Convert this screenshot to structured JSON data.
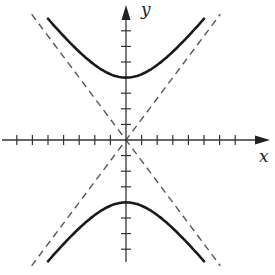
{
  "chart_data": {
    "type": "line",
    "title": "",
    "xlabel": "x",
    "ylabel": "y",
    "equation": "y^2/16 - x^2/9 = 1",
    "vertices": [
      [
        0,
        4
      ],
      [
        0,
        -4
      ]
    ],
    "asymptotes": [
      "y = 4/3 x",
      "y = -4/3 x"
    ],
    "xlim": [
      -8,
      9
    ],
    "ylim": [
      -8,
      9
    ],
    "tick_spacing": 1,
    "x_ticks": [
      -7,
      -6,
      -5,
      -4,
      -3,
      -2,
      -1,
      1,
      2,
      3,
      4,
      5,
      6,
      7
    ],
    "y_ticks": [
      -7,
      -6,
      -5,
      -4,
      -3,
      -2,
      -1,
      1,
      2,
      3,
      4,
      5,
      6,
      7
    ],
    "tick_labels_shown": false,
    "grid": false,
    "series": [
      {
        "name": "upper branch",
        "style": "solid",
        "x_range": [
          -5,
          5
        ]
      },
      {
        "name": "lower branch",
        "style": "solid",
        "x_range": [
          -5,
          5
        ]
      },
      {
        "name": "asymptote y=4/3x",
        "style": "dashed",
        "x_range": [
          -6,
          6
        ]
      },
      {
        "name": "asymptote y=-4/3x",
        "style": "dashed",
        "x_range": [
          -6,
          6
        ]
      }
    ],
    "colors": {
      "curve": "#1a1a1a",
      "asymptote": "#555555",
      "axis": "#333333"
    }
  },
  "labels": {
    "x_axis": "x",
    "y_axis": "y"
  }
}
